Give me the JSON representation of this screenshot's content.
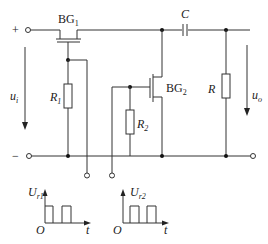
{
  "diagram": {
    "type": "circuit-schematic",
    "components": {
      "bg1": {
        "label": "BG",
        "sub": "1"
      },
      "bg2": {
        "label": "BG",
        "sub": "2"
      },
      "c": {
        "label": "C"
      },
      "r": {
        "label": "R"
      },
      "r1": {
        "label": "R",
        "sub": "1"
      },
      "r2": {
        "label": "R",
        "sub": "2"
      }
    },
    "terminals": {
      "plus": "+",
      "minus": "−"
    },
    "signals": {
      "ui": {
        "label": "u",
        "sub": "i"
      },
      "uo": {
        "label": "u",
        "sub": "o"
      }
    },
    "waveforms": [
      {
        "ylabel": "U",
        "ysub": "r1",
        "origin": "O",
        "xlabel": "t"
      },
      {
        "ylabel": "U",
        "ysub": "r2",
        "origin": "O",
        "xlabel": "t"
      }
    ],
    "colors": {
      "line": "#333333",
      "node": "#111111",
      "background": "#ffffff"
    }
  }
}
